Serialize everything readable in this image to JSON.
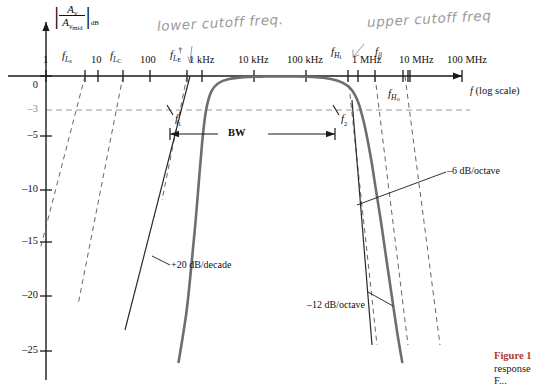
{
  "figure": {
    "type": "bode-frequency-response",
    "caption_lines": [
      "Figure 1",
      "response",
      "For this..."
    ],
    "caption_figure_number": "Figure 1",
    "caption_line2": "response",
    "caption_line3": "F..."
  },
  "axes": {
    "x_axis_title": "f (log scale)",
    "y_axis_numerator": "A",
    "y_axis_numerator_sub": "v",
    "y_axis_denominator": "A",
    "y_axis_denominator_sub": "v",
    "y_axis_denominator_sub2": "mid",
    "y_axis_unit": "dB",
    "x_ticks": [
      {
        "label": "1",
        "decade": 0,
        "type": "decade"
      },
      {
        "label": "10",
        "decade": 1,
        "type": "decade"
      },
      {
        "label": "100",
        "decade": 2,
        "type": "decade"
      },
      {
        "label": "1 kHz",
        "decade": 3,
        "type": "decade"
      },
      {
        "label": "10 kHz",
        "decade": 4,
        "type": "decade"
      },
      {
        "label": "100 kHz",
        "decade": 5,
        "type": "decade"
      },
      {
        "label": "1 MHz",
        "decade": 6,
        "type": "decade"
      },
      {
        "label": "10 MHz",
        "decade": 7,
        "type": "decade"
      },
      {
        "label": "100 MHz",
        "decade": 8,
        "type": "decade"
      }
    ],
    "y_ticks": [
      {
        "label": "0",
        "value": 0
      },
      {
        "label": "–3",
        "value": -3
      },
      {
        "label": "–5",
        "value": -5
      },
      {
        "label": "–10",
        "value": -10
      },
      {
        "label": "–15",
        "value": -15
      },
      {
        "label": "–20",
        "value": -20
      },
      {
        "label": "–25",
        "value": -25
      }
    ]
  },
  "cutoff_labels": {
    "f_Ls": {
      "base": "f",
      "sub": "L",
      "sub2": "s"
    },
    "f_Lc": {
      "base": "f",
      "sub": "L",
      "sub2": "C"
    },
    "f_LE": {
      "base": "f",
      "sub": "L",
      "sub2": "E",
      "dagger": "†"
    },
    "f_Hi": {
      "base": "f",
      "sub": "H",
      "sub2": "i"
    },
    "f_beta": {
      "base": "f",
      "sub": "β"
    },
    "f_Ho": {
      "base": "f",
      "sub": "H",
      "sub2": "o"
    },
    "f1": {
      "base": "f",
      "sub": "1"
    },
    "f2": {
      "base": "f",
      "sub": "2"
    }
  },
  "annotations": {
    "bandwidth": "BW",
    "slope_low": "+20 dB/decade",
    "slope_high_6": "–6 dB/octave",
    "slope_high_12": "–12 dB/octave",
    "handwritten_left": "lower cutoff freq.",
    "handwritten_right": "upper cutoff freq"
  },
  "colors": {
    "curve": "#6e6e6e",
    "curve_dark": "#2a2a2a",
    "dashed": "#555555",
    "axis": "#1a1a1a",
    "handwriting": "#9a9a9a",
    "caption_accent": "#b03a2e",
    "minus3_line": "#9a9a9a"
  },
  "chart_data": {
    "type": "line",
    "title": "",
    "xlabel": "f (log scale)",
    "ylabel": "|Av/Av(mid)| dB",
    "xscale": "log",
    "x_tick_labels": [
      "1",
      "10",
      "100",
      "1 kHz",
      "10 kHz",
      "100 kHz",
      "1 MHz",
      "10 MHz",
      "100 MHz"
    ],
    "y_tick_values": [
      0,
      -3,
      -5,
      -10,
      -15,
      -20,
      -25
    ],
    "ylim": [
      -27,
      1
    ],
    "xlim_decades": [
      0,
      8
    ],
    "grid": false,
    "legend": "none",
    "series": [
      {
        "name": "overall frequency response",
        "style": "solid-gray",
        "points_decade_db": [
          [
            2.55,
            -26.0
          ],
          [
            2.7,
            -21.5
          ],
          [
            2.8,
            -17.0
          ],
          [
            2.88,
            -13.0
          ],
          [
            2.95,
            -9.0
          ],
          [
            3.0,
            -6.2
          ],
          [
            3.05,
            -4.0
          ],
          [
            3.1,
            -2.6
          ],
          [
            3.18,
            -1.4
          ],
          [
            3.3,
            -0.7
          ],
          [
            3.5,
            -0.3
          ],
          [
            3.8,
            -0.1
          ],
          [
            4.2,
            -0.05
          ],
          [
            4.8,
            -0.05
          ],
          [
            5.2,
            -0.12
          ],
          [
            5.5,
            -0.3
          ],
          [
            5.7,
            -0.6
          ],
          [
            5.85,
            -1.1
          ],
          [
            5.95,
            -1.8
          ],
          [
            6.02,
            -2.6
          ],
          [
            6.08,
            -3.6
          ],
          [
            6.15,
            -5.0
          ],
          [
            6.25,
            -7.5
          ],
          [
            6.35,
            -10.5
          ],
          [
            6.45,
            -13.5
          ],
          [
            6.55,
            -16.8
          ],
          [
            6.65,
            -20.0
          ],
          [
            6.75,
            -23.2
          ],
          [
            6.85,
            -26.0
          ]
        ]
      }
    ],
    "asymptotes": [
      {
        "name": "f_Ls low-frequency asymptote",
        "slope": "+20 dB/decade",
        "style": "dashed"
      },
      {
        "name": "f_Lc low-frequency asymptote",
        "slope": "+20 dB/decade",
        "style": "dashed"
      },
      {
        "name": "f_LE low-frequency asymptote",
        "slope": "+20 dB/decade",
        "style": "dashed"
      },
      {
        "name": "f_Hi high-frequency asymptote",
        "slope": "-6 dB/octave",
        "style": "dashed"
      },
      {
        "name": "f_beta high-frequency asymptote",
        "slope": "-6 dB/octave",
        "style": "dashed"
      },
      {
        "name": "f_Ho high-frequency asymptote",
        "slope": "-6 dB/octave",
        "style": "dashed"
      }
    ],
    "markers": {
      "f1_db": -3,
      "f2_db": -3,
      "minus3db_reference_line": true,
      "bandwidth_span": "f1 to f2"
    }
  }
}
